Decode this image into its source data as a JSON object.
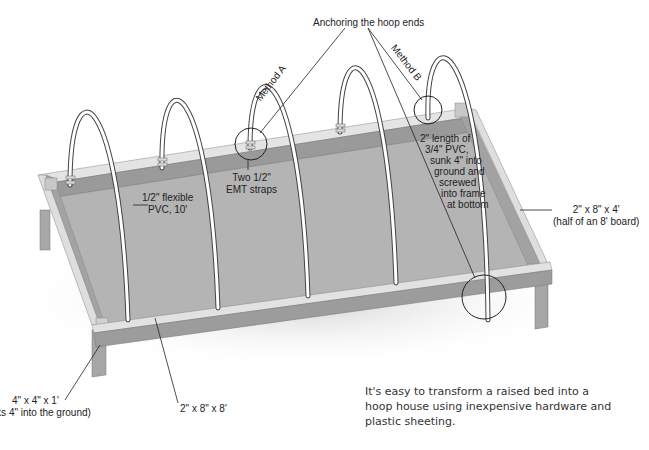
{
  "diagram": {
    "title": "Anchoring the hoop ends",
    "methods": {
      "a": "Method A",
      "b": "Method B"
    },
    "labels": {
      "pvc_hoop": [
        "1/2\" flexible",
        "PVC, 10'"
      ],
      "emt_straps": [
        "Two 1/2\"",
        "EMT straps"
      ],
      "pvc_sleeve": [
        "2\" length of",
        "3/4\" PVC,",
        "sunk 4\" into",
        "ground and",
        "screwed",
        "into frame",
        "at bottom"
      ],
      "end_board": [
        "2\" x 8\" x 4'",
        "(half of an 8' board)"
      ],
      "side_board": "2\" x 8\" x 8'",
      "post": [
        "4\" x 4\" x 1'",
        "(sinks 4\" into the ground)"
      ]
    },
    "caption": [
      "It's easy to transform a raised bed into a",
      "hoop house using inexpensive hardware and",
      "plastic sheeting."
    ],
    "colors": {
      "soil": "#b4b4b4",
      "board_top": "#dcdcdc",
      "board_face": "#9e9e9e",
      "hoop": "#ffffff",
      "outline": "#333333"
    }
  }
}
